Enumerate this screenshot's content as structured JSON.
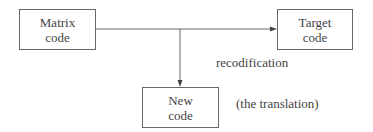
{
  "diagram": {
    "nodes": [
      {
        "id": "matrix",
        "label_line1": "Matrix",
        "label_line2": "code"
      },
      {
        "id": "target",
        "label_line1": "Target",
        "label_line2": "code"
      },
      {
        "id": "new",
        "label_line1": "New",
        "label_line2": "code"
      }
    ],
    "edges": [
      {
        "from": "matrix",
        "to": "target"
      },
      {
        "from": "matrix-line",
        "to": "new"
      }
    ],
    "annotations": {
      "recodification": "recodification",
      "translation": "(the translation)"
    },
    "colors": {
      "line": "#666666",
      "text": "#444444"
    }
  }
}
